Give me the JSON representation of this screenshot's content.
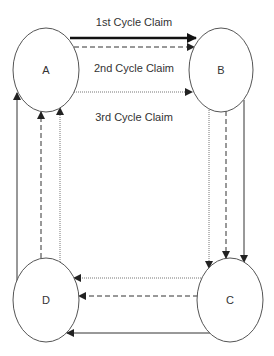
{
  "diagram": {
    "type": "cycle-flow",
    "colors": {
      "stroke": "#333333",
      "node_stroke": "#555555",
      "text": "#333333",
      "background": "#ffffff"
    },
    "nodes": [
      {
        "id": "A",
        "label": "A"
      },
      {
        "id": "B",
        "label": "B"
      },
      {
        "id": "C",
        "label": "C"
      },
      {
        "id": "D",
        "label": "D"
      }
    ],
    "cycles": [
      {
        "name": "1st Cycle Claim",
        "line_style": "thick-solid",
        "path": [
          "A",
          "B",
          "C",
          "D",
          "A"
        ]
      },
      {
        "name": "2nd Cycle Claim",
        "line_style": "dashed",
        "path": [
          "A",
          "B",
          "C",
          "D",
          "A"
        ]
      },
      {
        "name": "3rd Cycle Claim",
        "line_style": "dotted",
        "path": [
          "A",
          "B",
          "C",
          "D",
          "A"
        ]
      }
    ],
    "labels": {
      "cycle1": "1st Cycle Claim",
      "cycle2": "2nd Cycle Claim",
      "cycle3": "3rd Cycle Claim"
    }
  }
}
